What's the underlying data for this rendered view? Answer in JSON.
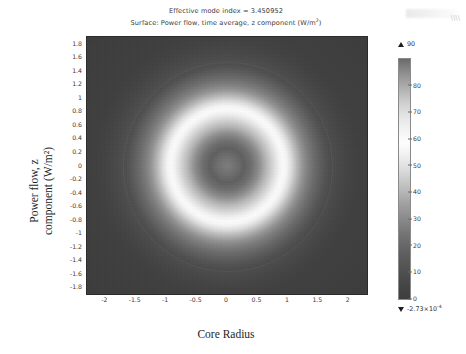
{
  "title": {
    "line1": "Effective mode index = 3.450952",
    "line2_prefix": "Surface: Power flow, time average, z component (W/m",
    "line2_sup": "2",
    "line2_suffix": ")"
  },
  "axes": {
    "xlabel": "Core Radius",
    "ylabel_line1": "Power flow, z",
    "ylabel_line2": "component (W/m²)",
    "xticks": [
      "-2",
      "-1.5",
      "-1",
      "-0.5",
      "0",
      "0.5",
      "1",
      "1.5",
      "2"
    ],
    "yticks": [
      "1.8",
      "1.6",
      "1.4",
      "1.2",
      "1",
      "0.8",
      "0.6",
      "0.4",
      "0.2",
      "0",
      "-0.2",
      "-0.4",
      "-0.6",
      "-0.8",
      "-1",
      "-1.2",
      "-1.4",
      "-1.6",
      "-1.8"
    ]
  },
  "colorbar": {
    "max_label": "90",
    "min_label_prefix": "-2.73×10",
    "min_label_exp": "-4",
    "ticks": [
      "80",
      "70",
      "60",
      "50",
      "40",
      "30",
      "20",
      "10",
      "0"
    ],
    "colormap": "grayscale"
  },
  "chart_data": {
    "type": "heatmap",
    "title": "Effective mode index = 3.450952",
    "subtitle": "Surface: Power flow, time average, z component (W/m^2)",
    "xlabel": "Core Radius",
    "ylabel": "Power flow, z component (W/m^2)",
    "xlim": [
      -2.3,
      2.3
    ],
    "ylim": [
      -1.9,
      1.9
    ],
    "xticks": [
      -2,
      -1.5,
      -1,
      -0.5,
      0,
      0.5,
      1,
      1.5,
      2
    ],
    "yticks": [
      1.8,
      1.6,
      1.4,
      1.2,
      1,
      0.8,
      0.6,
      0.4,
      0.2,
      0,
      -0.2,
      -0.4,
      -0.6,
      -0.8,
      -1,
      -1.2,
      -1.4,
      -1.6,
      -1.8
    ],
    "grid": false,
    "colormap": "grayscale",
    "zmin": -0.000273,
    "zmax": 90,
    "colorbar_ticks": [
      0,
      10,
      20,
      30,
      40,
      50,
      60,
      70,
      80,
      90
    ],
    "legend_position": "right",
    "radial_profile": {
      "radius": [
        0.0,
        0.1,
        0.2,
        0.3,
        0.4,
        0.5,
        0.6,
        0.7,
        0.8,
        0.9,
        1.0,
        1.1,
        1.2,
        1.3,
        1.5,
        1.8,
        2.2
      ],
      "value": [
        42,
        38,
        33,
        40,
        55,
        72,
        86,
        90,
        84,
        66,
        47,
        33,
        23,
        16,
        8,
        3,
        1
      ]
    }
  }
}
